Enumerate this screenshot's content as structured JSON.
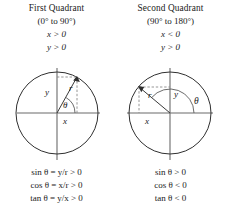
{
  "figure": {
    "background": "#ffffff",
    "ink": "#1a1a1a",
    "line_color": "#555555",
    "circle_color": "#333333"
  },
  "panels": [
    {
      "id": "first-quadrant",
      "title": "First Quadrant",
      "range": "(0° to 90°)",
      "condition_x": "x > 0",
      "condition_y": "y > 0",
      "diagram": {
        "radius_label": "r",
        "x_label": "x",
        "y_label": "y",
        "angle_label": "θ",
        "angle_degrees": 60,
        "circle_center": [
          57,
          57
        ],
        "circle_radius": 41,
        "point_on_circle": [
          77,
          21
        ]
      },
      "formulas": [
        "sin θ = y/r > 0",
        "cos θ = x/r > 0",
        "tan θ = y/x > 0"
      ]
    },
    {
      "id": "second-quadrant",
      "title": "Second Quadrant",
      "range": "(90° to 180°)",
      "condition_x": "x < 0",
      "condition_y": "y > 0",
      "diagram": {
        "radius_label": "r",
        "x_label": "x",
        "y_label": "y",
        "angle_label": "θ",
        "angle_degrees": 140,
        "circle_center": [
          56,
          57
        ],
        "circle_radius": 41,
        "point_on_circle": [
          25,
          31
        ]
      },
      "formulas": [
        "sin θ > 0",
        "cos θ < 0",
        "tan θ < 0"
      ]
    }
  ]
}
